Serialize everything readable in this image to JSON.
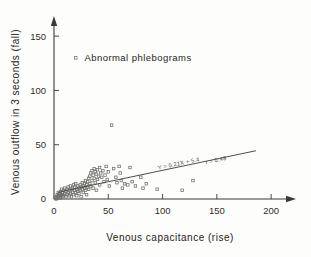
{
  "chart_data": {
    "type": "scatter",
    "title": "",
    "xlabel": "Venous capacitance (rise)",
    "ylabel": "Venous outflow in 3 seconds (fall)",
    "xlim": [
      0,
      210
    ],
    "ylim": [
      0,
      163
    ],
    "xticks": [
      0,
      50,
      100,
      150,
      200
    ],
    "yticks": [
      0,
      50,
      100,
      150
    ],
    "xtick_labels": [
      "0",
      "50",
      "100",
      "150",
      "200"
    ],
    "ytick_labels": [
      "0",
      "50",
      "100",
      "150"
    ],
    "grid": false,
    "legend_position": "upper-left-inside",
    "series": [
      {
        "name": "Abnormal phlebograms",
        "marker": "open-square",
        "points": [
          [
            1,
            1
          ],
          [
            2,
            2
          ],
          [
            2,
            0
          ],
          [
            3,
            4
          ],
          [
            3,
            1
          ],
          [
            4,
            3
          ],
          [
            4,
            6
          ],
          [
            5,
            2
          ],
          [
            5,
            5
          ],
          [
            6,
            1
          ],
          [
            6,
            7
          ],
          [
            6,
            3
          ],
          [
            7,
            4
          ],
          [
            7,
            9
          ],
          [
            8,
            2
          ],
          [
            8,
            6
          ],
          [
            9,
            8
          ],
          [
            9,
            3
          ],
          [
            10,
            5
          ],
          [
            10,
            10
          ],
          [
            11,
            7
          ],
          [
            11,
            2
          ],
          [
            12,
            9
          ],
          [
            12,
            4
          ],
          [
            13,
            11
          ],
          [
            13,
            6
          ],
          [
            14,
            3
          ],
          [
            14,
            8
          ],
          [
            15,
            12
          ],
          [
            15,
            5
          ],
          [
            16,
            9
          ],
          [
            16,
            2
          ],
          [
            17,
            10
          ],
          [
            17,
            6
          ],
          [
            18,
            13
          ],
          [
            18,
            4
          ],
          [
            19,
            8
          ],
          [
            19,
            11
          ],
          [
            20,
            6
          ],
          [
            20,
            14
          ],
          [
            21,
            9
          ],
          [
            21,
            3
          ],
          [
            22,
            12
          ],
          [
            22,
            7
          ],
          [
            23,
            10
          ],
          [
            23,
            5
          ],
          [
            24,
            13
          ],
          [
            24,
            8
          ],
          [
            25,
            11
          ],
          [
            25,
            2
          ],
          [
            26,
            15
          ],
          [
            26,
            9
          ],
          [
            27,
            12
          ],
          [
            27,
            6
          ],
          [
            28,
            14
          ],
          [
            28,
            10
          ],
          [
            29,
            8
          ],
          [
            29,
            17
          ],
          [
            30,
            13
          ],
          [
            30,
            4
          ],
          [
            31,
            16
          ],
          [
            31,
            11
          ],
          [
            32,
            19
          ],
          [
            32,
            9
          ],
          [
            33,
            21
          ],
          [
            33,
            14
          ],
          [
            34,
            24
          ],
          [
            34,
            12
          ],
          [
            35,
            26
          ],
          [
            35,
            17
          ],
          [
            36,
            22
          ],
          [
            36,
            10
          ],
          [
            37,
            28
          ],
          [
            37,
            19
          ],
          [
            38,
            25
          ],
          [
            38,
            15
          ],
          [
            39,
            23
          ],
          [
            39,
            8
          ],
          [
            40,
            27
          ],
          [
            40,
            18
          ],
          [
            41,
            21
          ],
          [
            42,
            29
          ],
          [
            42,
            13
          ],
          [
            43,
            24
          ],
          [
            44,
            20
          ],
          [
            45,
            26
          ],
          [
            46,
            16
          ],
          [
            47,
            22
          ],
          [
            48,
            30
          ],
          [
            49,
            18
          ],
          [
            50,
            25
          ],
          [
            51,
            12
          ],
          [
            53,
            68
          ],
          [
            55,
            28
          ],
          [
            57,
            20
          ],
          [
            58,
            15
          ],
          [
            60,
            30
          ],
          [
            61,
            24
          ],
          [
            62,
            17
          ],
          [
            63,
            10
          ],
          [
            65,
            14
          ],
          [
            68,
            13
          ],
          [
            70,
            29
          ],
          [
            72,
            16
          ],
          [
            75,
            12
          ],
          [
            80,
            20
          ],
          [
            82,
            10
          ],
          [
            85,
            14
          ],
          [
            95,
            9
          ],
          [
            118,
            8
          ],
          [
            128,
            17
          ]
        ]
      }
    ],
    "annotations": [
      {
        "text": "Abnormal phlebograms",
        "x": 28,
        "y": 130
      },
      {
        "text": "Y = 0.21X + 5.4",
        "x": 96,
        "y": 27
      },
      {
        "text": "r = 0.48",
        "x": 140,
        "y": 32
      }
    ],
    "regression": {
      "equation": "Y = 0.21X + 5.4",
      "correlation": "r = 0.48",
      "slope": 0.21,
      "intercept": 5.4,
      "x_start": 4,
      "x_end": 186
    },
    "colors": {
      "ink": "#3a3a38",
      "marker": "#6e6e6b",
      "background": "#fdfdfb"
    }
  }
}
